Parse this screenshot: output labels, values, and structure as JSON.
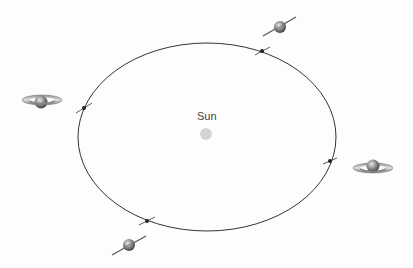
{
  "diagram": {
    "sun": {
      "label": "Sun",
      "color": "#d4d4d4",
      "cx": 206,
      "cy": 134
    },
    "orbit": {
      "cx": 207,
      "cy": 137,
      "rx": 129,
      "ry": 94,
      "color": "#333333"
    },
    "positions": [
      {
        "name": "top",
        "marker": [
          262,
          51
        ],
        "planet": [
          280,
          27
        ],
        "view": "edge-tilted"
      },
      {
        "name": "left",
        "marker": [
          84,
          108
        ],
        "planet": [
          41,
          102
        ],
        "view": "rings-open"
      },
      {
        "name": "right",
        "marker": [
          330,
          161
        ],
        "planet": [
          373,
          167
        ],
        "view": "rings-open"
      },
      {
        "name": "bottom",
        "marker": [
          147,
          221
        ],
        "planet": [
          129,
          245
        ],
        "view": "edge-tilted"
      }
    ]
  }
}
